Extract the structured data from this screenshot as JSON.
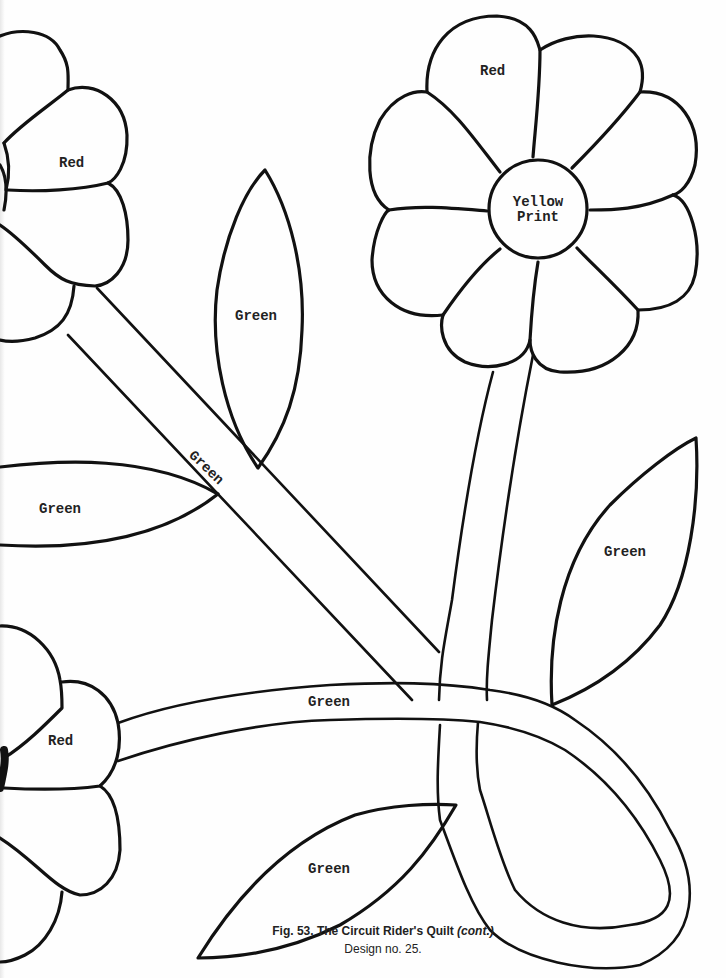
{
  "figure": {
    "caption_title": "Fig. 53. The Circuit Rider's Quilt",
    "caption_suffix": "(cont.)",
    "caption_subtitle": "Design no. 25."
  },
  "pattern_pieces": {
    "top_right_flower": {
      "petal_label": "Red",
      "center_label_line1": "Yellow",
      "center_label_line2": "Print"
    },
    "top_left_flower": {
      "petal_label": "Red"
    },
    "bottom_left_flower": {
      "petal_label": "Red"
    },
    "upper_leaf": {
      "label": "Green"
    },
    "left_leaf": {
      "label": "Green"
    },
    "diagonal_stem": {
      "label": "Green"
    },
    "right_leaf": {
      "label": "Green"
    },
    "horizontal_stem": {
      "label": "Green"
    },
    "bottom_leaf": {
      "label": "Green"
    }
  },
  "colors": {
    "line": "#111111",
    "paper": "#fefefe"
  }
}
